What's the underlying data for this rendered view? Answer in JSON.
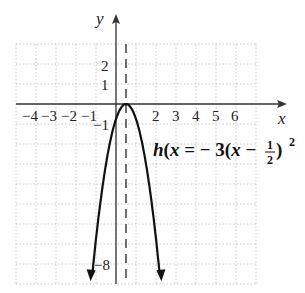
{
  "chart_data": {
    "type": "line",
    "title": "",
    "function_label": "h(x) = −3(x − 1/2)²",
    "equation": {
      "prefix": "h",
      "var": "x",
      "eq": " = − 3(",
      "var2": "x",
      "minus": " − ",
      "num": "1",
      "den": "2",
      "close": ")",
      "exp": "2"
    },
    "xlabel": "x",
    "ylabel": "y",
    "x_ticks": [
      "−4",
      "−3",
      "−2",
      "−1",
      "2",
      "3",
      "4",
      "5",
      "6"
    ],
    "y_ticks": [
      "2",
      "1",
      "−1",
      "−8"
    ],
    "xlim": [
      -5,
      7
    ],
    "ylim": [
      -9,
      3
    ],
    "grid": true,
    "vertex": [
      0.5,
      0
    ],
    "axis_of_symmetry": "x = 1/2",
    "series": [
      {
        "name": "h(x)",
        "x": [
          -1.2,
          -1,
          -0.5,
          0,
          0.5,
          1,
          1.5,
          2,
          2.2
        ],
        "values": [
          -8.67,
          -6.75,
          -3,
          -0.75,
          0,
          -0.75,
          -3,
          -6.75,
          -8.67
        ]
      }
    ]
  }
}
